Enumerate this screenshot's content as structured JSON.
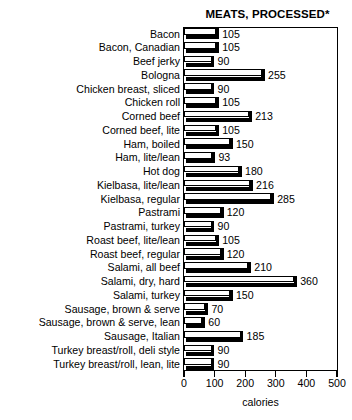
{
  "chart_data": {
    "type": "bar",
    "orientation": "horizontal",
    "title": "MEATS, PROCESSED*",
    "xlabel": "calories",
    "ylabel": "",
    "xlim": [
      0,
      500
    ],
    "xticks": [
      0,
      100,
      200,
      300,
      400,
      500
    ],
    "xticklabels": [
      "0",
      "100",
      "200",
      "300",
      "400",
      "500"
    ],
    "grid": false,
    "legend": null,
    "value_labels": true,
    "categories": [
      "Bacon",
      "Bacon, Canadian",
      "Beef jerky",
      "Bologna",
      "Chicken breast, sliced",
      "Chicken roll",
      "Corned beef",
      "Corned beef, lite",
      "Ham, boiled",
      "Ham, lite/lean",
      "Hot dog",
      "Kielbasa, lite/lean",
      "Kielbasa, regular",
      "Pastrami",
      "Pastrami, turkey",
      "Roast beef, lite/lean",
      "Roast beef, regular",
      "Salami, all beef",
      "Salami, dry, hard",
      "Salami, turkey",
      "Sausage, brown & serve",
      "Sausage, brown & serve, lean",
      "Sausage, Italian",
      "Turkey breast/roll, deli style",
      "Turkey breast/roll, lean, lite"
    ],
    "values": [
      105,
      105,
      90,
      255,
      90,
      105,
      213,
      105,
      150,
      93,
      180,
      216,
      285,
      120,
      90,
      105,
      120,
      210,
      360,
      150,
      70,
      60,
      185,
      90,
      90
    ],
    "value_label_texts": [
      "105",
      "105",
      "90",
      "255",
      "90",
      "105",
      "213",
      "105",
      "150",
      "93",
      "180",
      "216",
      "285",
      "120",
      "90",
      "105",
      "120",
      "210",
      "360",
      "150",
      "70",
      "60",
      "185",
      "90",
      "90"
    ]
  },
  "colors": {
    "bar_face": "#ffffff",
    "bar_edge": "#000000",
    "bar_shadow": "#000000",
    "background": "#ffffff",
    "text": "#000000"
  }
}
